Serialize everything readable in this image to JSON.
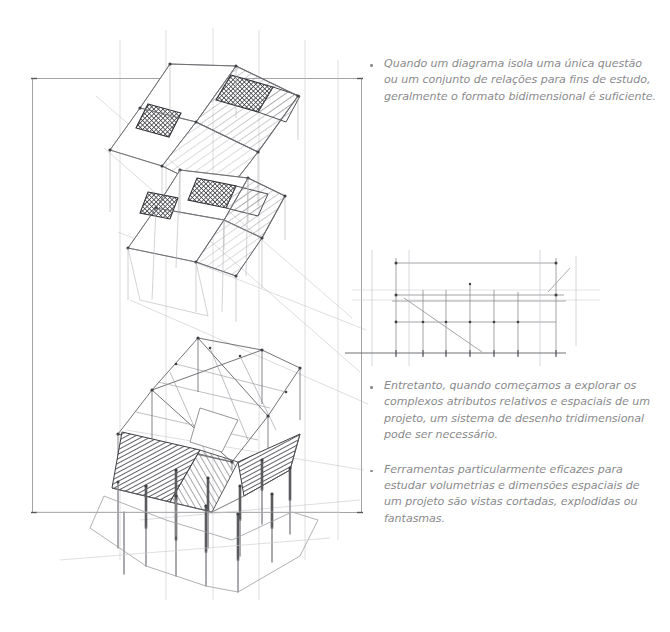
{
  "page": {
    "background_color": "#ffffff",
    "ink_color": "#6f7074",
    "text_color": "#8a8a8c",
    "frame": {
      "left": 32,
      "top": 78,
      "right": 362,
      "bottom": 513,
      "stroke_color": "#9a9a9c"
    }
  },
  "bullets": {
    "top": [
      {
        "id": "bullet-2d-format",
        "marker": "bullet-dot",
        "text": "Quando um diagrama isola uma única questão ou um conjunto de relações para fins de estudo, geralmente o formato bidimensional é suficiente."
      }
    ],
    "bottom": [
      {
        "id": "bullet-3d-system",
        "marker": "bullet-dot",
        "text": "Entretanto, quando começamos a explorar os complexos atributos relativos e espaciais de um projeto, um sistema de desenho tridimensional pode ser necessário."
      },
      {
        "id": "bullet-cut-views",
        "marker": "bullet-dot",
        "text": "Ferramentas particularmente eficazes para estudar volumetrias e dimensões espaciais de um projeto são vistas cortadas, explodidas ou fantasmas."
      }
    ]
  },
  "drawings": {
    "axonometric": {
      "name": "stacked-axonometric-building-study",
      "description": "Pencil axonometric of a stacked multi-level building: three floor plates with diagonal hatching, dark crosshatched service cores, a heavily shaded ground slab and a grid of pilotis columns below.",
      "levels": [
        {
          "label": "upper-floor-plate",
          "hatch": "diagonal",
          "cores": 2
        },
        {
          "label": "middle-floor-plate",
          "hatch": "diagonal",
          "cores": 2
        },
        {
          "label": "lower-floor-structure",
          "hatch": "light-frame",
          "cores": 0
        },
        {
          "label": "ground-slab",
          "hatch": "dense-shading",
          "cores": 0
        },
        {
          "label": "pilotis-columns",
          "hatch": "none",
          "columns": 14
        }
      ]
    },
    "elevation": {
      "name": "small-elevation-section-sketch",
      "description": "Light pencil elevation/section with horizontal datum lines, vertical grid ticks and a diagonal ramp line, sitting above a ruled ground line.",
      "ground_line_y": 353,
      "ground_line_span": [
        345,
        566
      ]
    }
  }
}
